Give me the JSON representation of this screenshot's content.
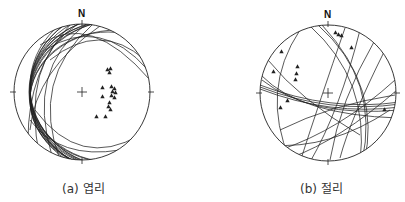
{
  "panels": [
    {
      "id": "a",
      "caption": "(a) 엽리",
      "north_label": "N",
      "center": [
        82,
        92
      ],
      "radius": 68,
      "poles_count": 20,
      "great_circle_count": 22
    },
    {
      "id": "b",
      "caption": "(b) 절리",
      "north_label": "N",
      "center": [
        328,
        93
      ],
      "radius": 68,
      "poles_count": 12,
      "great_circle_count": 18
    }
  ],
  "colors": {
    "line": "#222222",
    "text": "#333333",
    "background": "#ffffff"
  }
}
